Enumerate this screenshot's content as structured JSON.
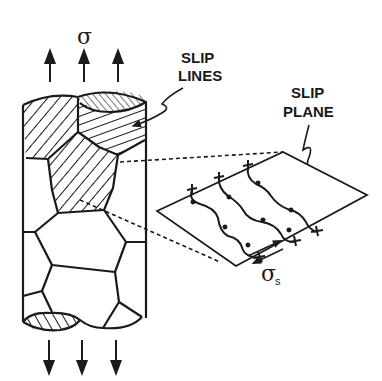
{
  "figure": {
    "type": "polycrystal slip diagram",
    "stress_label": "σ",
    "shear_stress_label": "σ",
    "shear_stress_subscript": "s",
    "labels": {
      "slip_lines_line1": "SLIP",
      "slip_lines_line2": "LINES",
      "slip_plane_line1": "SLIP",
      "slip_plane_line2": "PLANE"
    },
    "colors": {
      "ink": "#1a1a1a",
      "background": "#ffffff"
    },
    "arrows": {
      "top_count": 3,
      "bottom_count": 3,
      "top_direction": "up",
      "bottom_direction": "down"
    }
  }
}
